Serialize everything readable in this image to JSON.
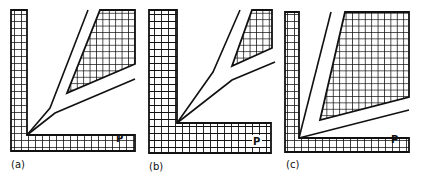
{
  "figure": {
    "panels": [
      {
        "label": "(a)",
        "point_label": "P"
      },
      {
        "label": "(b)",
        "point_label": "P"
      },
      {
        "label": "(c)",
        "point_label": "P"
      }
    ]
  }
}
